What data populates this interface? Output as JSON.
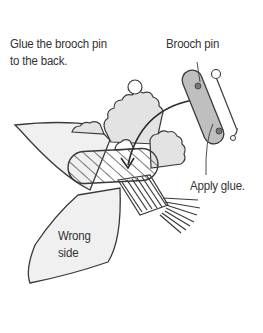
{
  "labels": {
    "instruction_line1": "Glue the brooch pin",
    "instruction_line2": "to the back.",
    "brooch_pin": "Brooch pin",
    "apply_glue": "Apply glue.",
    "wrong_side_line1": "Wrong",
    "wrong_side_line2": "side"
  },
  "colors": {
    "line": "#3a3a3a",
    "fabric_fill": "#efefef",
    "bloom_fill": "#e2e2e2",
    "pin_fill": "#bdbdbd",
    "glue_fill": "#d0d0d0",
    "text": "#333333"
  }
}
